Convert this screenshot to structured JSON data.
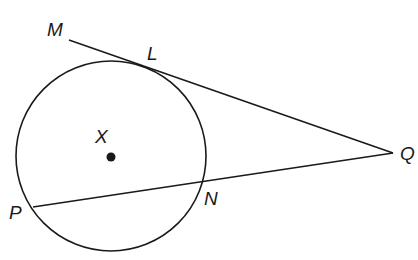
{
  "diagram": {
    "type": "circle with tangent and secant",
    "circle": {
      "center_label": "X",
      "cx": 111,
      "cy": 156,
      "r": 95
    },
    "points": {
      "M": {
        "x": 69,
        "y": 40
      },
      "L": {
        "x": 128,
        "y": 63
      },
      "Q": {
        "x": 393,
        "y": 153
      },
      "P": {
        "x": 33,
        "y": 207
      },
      "N": {
        "x": 205,
        "y": 183
      }
    },
    "segments": [
      {
        "name": "tangent",
        "from": "M",
        "to": "Q"
      },
      {
        "name": "secant",
        "from": "Q",
        "to": "P"
      }
    ],
    "labels": {
      "M": "M",
      "L": "L",
      "X": "X",
      "Q": "Q",
      "P": "P",
      "N": "N"
    },
    "stroke_color": "#1a1a1a"
  }
}
